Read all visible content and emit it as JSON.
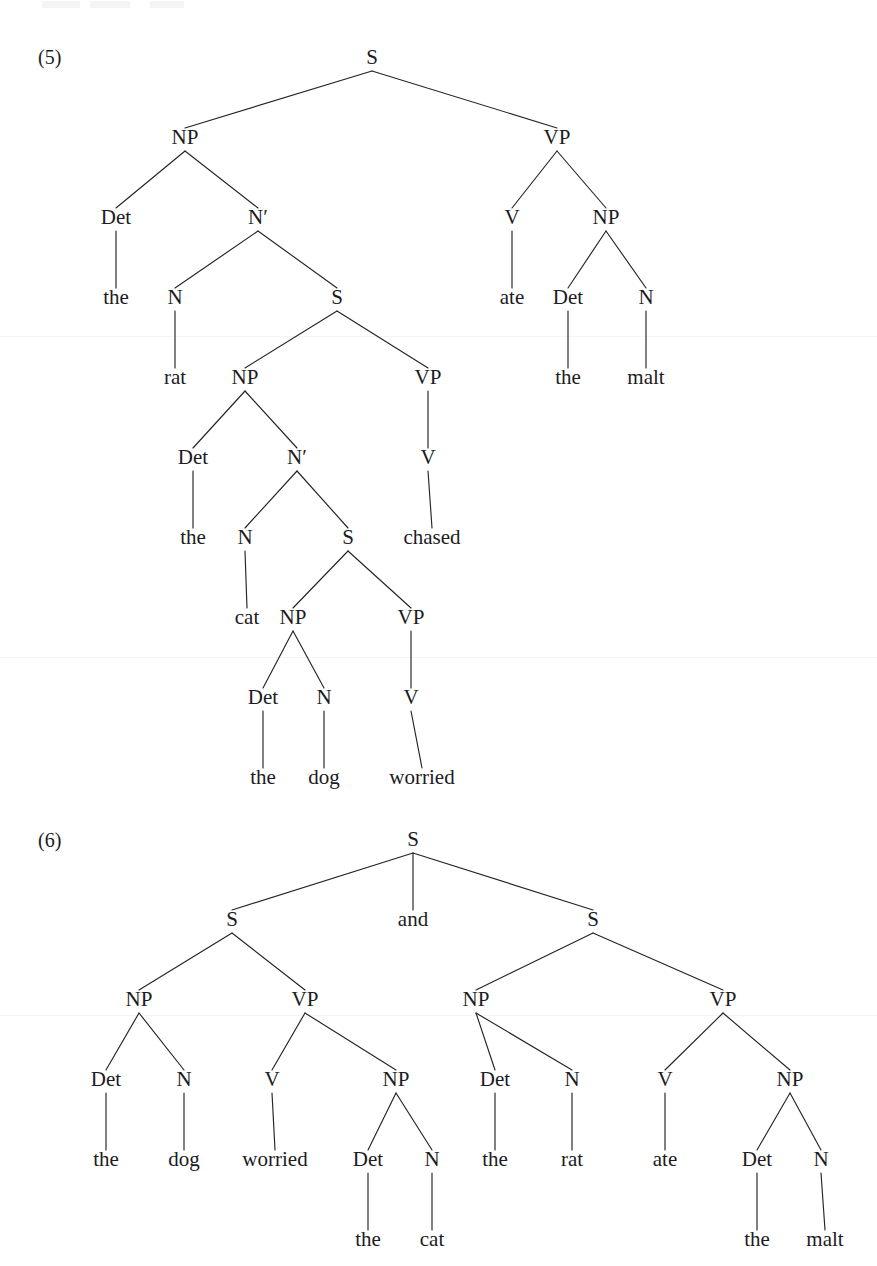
{
  "page": {
    "background": "#ffffff",
    "ink_color": "#1b1b22",
    "width": 877,
    "height": 1266
  },
  "examples": [
    {
      "id": "example-5",
      "number": "(5)",
      "number_x": 38,
      "number_y": 64,
      "sentence": "the rat the cat the dog worried chased ate the malt",
      "nodes": [
        {
          "name": "s-root",
          "label": "S",
          "x": 372,
          "y": 64,
          "type": "category"
        },
        {
          "name": "np-subject",
          "label": "NP",
          "x": 185,
          "y": 144,
          "type": "category"
        },
        {
          "name": "vp-main",
          "label": "VP",
          "x": 557,
          "y": 144,
          "type": "category"
        },
        {
          "name": "det-1",
          "label": "Det",
          "x": 116,
          "y": 224,
          "type": "category"
        },
        {
          "name": "nbar-1",
          "label": "N′",
          "x": 258,
          "y": 224,
          "type": "category"
        },
        {
          "name": "v-main",
          "label": "V",
          "x": 512,
          "y": 224,
          "type": "category"
        },
        {
          "name": "np-object",
          "label": "NP",
          "x": 606,
          "y": 224,
          "type": "category"
        },
        {
          "name": "the-1",
          "label": "the",
          "x": 116,
          "y": 304,
          "type": "terminal"
        },
        {
          "name": "n-1",
          "label": "N",
          "x": 175,
          "y": 304,
          "type": "category"
        },
        {
          "name": "s-relative-1",
          "label": "S",
          "x": 337,
          "y": 304,
          "type": "category"
        },
        {
          "name": "ate",
          "label": "ate",
          "x": 512,
          "y": 304,
          "type": "terminal"
        },
        {
          "name": "det-object",
          "label": "Det",
          "x": 568,
          "y": 304,
          "type": "category"
        },
        {
          "name": "n-object",
          "label": "N",
          "x": 646,
          "y": 304,
          "type": "category"
        },
        {
          "name": "rat",
          "label": "rat",
          "x": 175,
          "y": 384,
          "type": "terminal"
        },
        {
          "name": "np-embedded-1",
          "label": "NP",
          "x": 245,
          "y": 384,
          "type": "category"
        },
        {
          "name": "vp-embedded-1",
          "label": "VP",
          "x": 428,
          "y": 384,
          "type": "category"
        },
        {
          "name": "the-object",
          "label": "the",
          "x": 568,
          "y": 384,
          "type": "terminal"
        },
        {
          "name": "malt",
          "label": "malt",
          "x": 646,
          "y": 384,
          "type": "terminal"
        },
        {
          "name": "det-2",
          "label": "Det",
          "x": 193,
          "y": 464,
          "type": "category"
        },
        {
          "name": "nbar-2",
          "label": "N′",
          "x": 297,
          "y": 464,
          "type": "category"
        },
        {
          "name": "v-embedded-1",
          "label": "V",
          "x": 428,
          "y": 464,
          "type": "category"
        },
        {
          "name": "the-2",
          "label": "the",
          "x": 193,
          "y": 544,
          "type": "terminal"
        },
        {
          "name": "n-2",
          "label": "N",
          "x": 245,
          "y": 544,
          "type": "category"
        },
        {
          "name": "s-relative-2",
          "label": "S",
          "x": 348,
          "y": 544,
          "type": "category"
        },
        {
          "name": "chased",
          "label": "chased",
          "x": 432,
          "y": 544,
          "type": "terminal"
        },
        {
          "name": "cat",
          "label": "cat",
          "x": 247,
          "y": 624,
          "type": "terminal"
        },
        {
          "name": "np-embedded-2",
          "label": "NP",
          "x": 293,
          "y": 624,
          "type": "category"
        },
        {
          "name": "vp-embedded-2",
          "label": "VP",
          "x": 411,
          "y": 624,
          "type": "category"
        },
        {
          "name": "det-3",
          "label": "Det",
          "x": 263,
          "y": 704,
          "type": "category"
        },
        {
          "name": "n-3",
          "label": "N",
          "x": 324,
          "y": 704,
          "type": "category"
        },
        {
          "name": "v-embedded-2",
          "label": "V",
          "x": 411,
          "y": 704,
          "type": "category"
        },
        {
          "name": "the-3",
          "label": "the",
          "x": 263,
          "y": 784,
          "type": "terminal"
        },
        {
          "name": "dog",
          "label": "dog",
          "x": 324,
          "y": 784,
          "type": "terminal"
        },
        {
          "name": "worried",
          "label": "worried",
          "x": 422,
          "y": 784,
          "type": "terminal"
        }
      ],
      "edges": [
        {
          "name": "edge-s-np",
          "from": "s-root",
          "to": "np-subject"
        },
        {
          "name": "edge-s-vp",
          "from": "s-root",
          "to": "vp-main"
        },
        {
          "name": "edge-np-det",
          "from": "np-subject",
          "to": "det-1"
        },
        {
          "name": "edge-np-nbar",
          "from": "np-subject",
          "to": "nbar-1"
        },
        {
          "name": "edge-vp-v",
          "from": "vp-main",
          "to": "v-main"
        },
        {
          "name": "edge-vp-np",
          "from": "vp-main",
          "to": "np-object"
        },
        {
          "name": "edge-det1-the",
          "from": "det-1",
          "to": "the-1"
        },
        {
          "name": "edge-nbar1-n",
          "from": "nbar-1",
          "to": "n-1"
        },
        {
          "name": "edge-nbar1-s",
          "from": "nbar-1",
          "to": "s-relative-1"
        },
        {
          "name": "edge-vmain-ate",
          "from": "v-main",
          "to": "ate"
        },
        {
          "name": "edge-npobj-det",
          "from": "np-object",
          "to": "det-object"
        },
        {
          "name": "edge-npobj-n",
          "from": "np-object",
          "to": "n-object"
        },
        {
          "name": "edge-n1-rat",
          "from": "n-1",
          "to": "rat"
        },
        {
          "name": "edge-srel1-np",
          "from": "s-relative-1",
          "to": "np-embedded-1"
        },
        {
          "name": "edge-srel1-vp",
          "from": "s-relative-1",
          "to": "vp-embedded-1"
        },
        {
          "name": "edge-detobj-the",
          "from": "det-object",
          "to": "the-object"
        },
        {
          "name": "edge-nobj-malt",
          "from": "n-object",
          "to": "malt"
        },
        {
          "name": "edge-npemb1-det",
          "from": "np-embedded-1",
          "to": "det-2"
        },
        {
          "name": "edge-npemb1-nbar",
          "from": "np-embedded-1",
          "to": "nbar-2"
        },
        {
          "name": "edge-vpemb1-v",
          "from": "vp-embedded-1",
          "to": "v-embedded-1"
        },
        {
          "name": "edge-det2-the",
          "from": "det-2",
          "to": "the-2"
        },
        {
          "name": "edge-nbar2-n",
          "from": "nbar-2",
          "to": "n-2"
        },
        {
          "name": "edge-nbar2-s",
          "from": "nbar-2",
          "to": "s-relative-2"
        },
        {
          "name": "edge-vemb1-chased",
          "from": "v-embedded-1",
          "to": "chased"
        },
        {
          "name": "edge-n2-cat",
          "from": "n-2",
          "to": "cat"
        },
        {
          "name": "edge-srel2-np",
          "from": "s-relative-2",
          "to": "np-embedded-2"
        },
        {
          "name": "edge-srel2-vp",
          "from": "s-relative-2",
          "to": "vp-embedded-2"
        },
        {
          "name": "edge-npemb2-det",
          "from": "np-embedded-2",
          "to": "det-3"
        },
        {
          "name": "edge-npemb2-n",
          "from": "np-embedded-2",
          "to": "n-3"
        },
        {
          "name": "edge-vpemb2-v",
          "from": "vp-embedded-2",
          "to": "v-embedded-2"
        },
        {
          "name": "edge-det3-the",
          "from": "det-3",
          "to": "the-3"
        },
        {
          "name": "edge-n3-dog",
          "from": "n-3",
          "to": "dog"
        },
        {
          "name": "edge-vemb2-worried",
          "from": "v-embedded-2",
          "to": "worried"
        }
      ]
    },
    {
      "id": "example-6",
      "number": "(6)",
      "number_x": 38,
      "number_y": 847,
      "sentence": "the dog worried the cat and the rat ate the malt",
      "nodes": [
        {
          "name": "s-root",
          "label": "S",
          "x": 413,
          "y": 846,
          "type": "category"
        },
        {
          "name": "s-left",
          "label": "S",
          "x": 232,
          "y": 926,
          "type": "category"
        },
        {
          "name": "and",
          "label": "and",
          "x": 413,
          "y": 926,
          "type": "terminal"
        },
        {
          "name": "s-right",
          "label": "S",
          "x": 593,
          "y": 926,
          "type": "category"
        },
        {
          "name": "np-left",
          "label": "NP",
          "x": 139,
          "y": 1006,
          "type": "category"
        },
        {
          "name": "vp-left",
          "label": "VP",
          "x": 305,
          "y": 1006,
          "type": "category"
        },
        {
          "name": "np-right",
          "label": "NP",
          "x": 476,
          "y": 1006,
          "type": "category"
        },
        {
          "name": "vp-right",
          "label": "VP",
          "x": 723,
          "y": 1006,
          "type": "category"
        },
        {
          "name": "det-left-subj",
          "label": "Det",
          "x": 106,
          "y": 1086,
          "type": "category"
        },
        {
          "name": "n-left-subj",
          "label": "N",
          "x": 184,
          "y": 1086,
          "type": "category"
        },
        {
          "name": "v-left",
          "label": "V",
          "x": 272,
          "y": 1086,
          "type": "category"
        },
        {
          "name": "np-left-obj",
          "label": "NP",
          "x": 396,
          "y": 1086,
          "type": "category"
        },
        {
          "name": "det-right-subj",
          "label": "Det",
          "x": 495,
          "y": 1086,
          "type": "category"
        },
        {
          "name": "n-right-subj",
          "label": "N",
          "x": 572,
          "y": 1086,
          "type": "category"
        },
        {
          "name": "v-right",
          "label": "V",
          "x": 665,
          "y": 1086,
          "type": "category"
        },
        {
          "name": "np-right-obj",
          "label": "NP",
          "x": 790,
          "y": 1086,
          "type": "category"
        },
        {
          "name": "the-left-subj",
          "label": "the",
          "x": 106,
          "y": 1166,
          "type": "terminal"
        },
        {
          "name": "dog",
          "label": "dog",
          "x": 184,
          "y": 1166,
          "type": "terminal"
        },
        {
          "name": "worried",
          "label": "worried",
          "x": 275,
          "y": 1166,
          "type": "terminal"
        },
        {
          "name": "det-left-obj",
          "label": "Det",
          "x": 368,
          "y": 1166,
          "type": "category"
        },
        {
          "name": "n-left-obj",
          "label": "N",
          "x": 432,
          "y": 1166,
          "type": "category"
        },
        {
          "name": "the-right-subj",
          "label": "the",
          "x": 495,
          "y": 1166,
          "type": "terminal"
        },
        {
          "name": "rat",
          "label": "rat",
          "x": 572,
          "y": 1166,
          "type": "terminal"
        },
        {
          "name": "ate",
          "label": "ate",
          "x": 665,
          "y": 1166,
          "type": "terminal"
        },
        {
          "name": "det-right-obj",
          "label": "Det",
          "x": 757,
          "y": 1166,
          "type": "category"
        },
        {
          "name": "n-right-obj",
          "label": "N",
          "x": 821,
          "y": 1166,
          "type": "category"
        },
        {
          "name": "the-left-obj",
          "label": "the",
          "x": 368,
          "y": 1246,
          "type": "terminal"
        },
        {
          "name": "cat",
          "label": "cat",
          "x": 432,
          "y": 1246,
          "type": "terminal"
        },
        {
          "name": "the-right-obj",
          "label": "the",
          "x": 757,
          "y": 1246,
          "type": "terminal"
        },
        {
          "name": "malt",
          "label": "malt",
          "x": 825,
          "y": 1246,
          "type": "terminal"
        }
      ],
      "edges": [
        {
          "name": "edge-root-sleft",
          "from": "s-root",
          "to": "s-left"
        },
        {
          "name": "edge-root-and",
          "from": "s-root",
          "to": "and"
        },
        {
          "name": "edge-root-sright",
          "from": "s-root",
          "to": "s-right"
        },
        {
          "name": "edge-sleft-np",
          "from": "s-left",
          "to": "np-left"
        },
        {
          "name": "edge-sleft-vp",
          "from": "s-left",
          "to": "vp-left"
        },
        {
          "name": "edge-sright-np",
          "from": "s-right",
          "to": "np-right"
        },
        {
          "name": "edge-sright-vp",
          "from": "s-right",
          "to": "vp-right"
        },
        {
          "name": "edge-npleft-det",
          "from": "np-left",
          "to": "det-left-subj"
        },
        {
          "name": "edge-npleft-n",
          "from": "np-left",
          "to": "n-left-subj"
        },
        {
          "name": "edge-vpleft-v",
          "from": "vp-left",
          "to": "v-left"
        },
        {
          "name": "edge-vpleft-np",
          "from": "vp-left",
          "to": "np-left-obj"
        },
        {
          "name": "edge-npright-det",
          "from": "np-right",
          "to": "det-right-subj"
        },
        {
          "name": "edge-npright-n",
          "from": "np-right",
          "to": "n-right-subj"
        },
        {
          "name": "edge-vpright-v",
          "from": "vp-right",
          "to": "v-right"
        },
        {
          "name": "edge-vpright-np",
          "from": "vp-right",
          "to": "np-right-obj"
        },
        {
          "name": "edge-detleftsubj-the",
          "from": "det-left-subj",
          "to": "the-left-subj"
        },
        {
          "name": "edge-nleftsubj-dog",
          "from": "n-left-subj",
          "to": "dog"
        },
        {
          "name": "edge-vleft-worried",
          "from": "v-left",
          "to": "worried"
        },
        {
          "name": "edge-npleftobj-det",
          "from": "np-left-obj",
          "to": "det-left-obj"
        },
        {
          "name": "edge-npleftobj-n",
          "from": "np-left-obj",
          "to": "n-left-obj"
        },
        {
          "name": "edge-detrightsubj-the",
          "from": "det-right-subj",
          "to": "the-right-subj"
        },
        {
          "name": "edge-nrightsubj-rat",
          "from": "n-right-subj",
          "to": "rat"
        },
        {
          "name": "edge-vright-ate",
          "from": "v-right",
          "to": "ate"
        },
        {
          "name": "edge-nprightobj-det",
          "from": "np-right-obj",
          "to": "det-right-obj"
        },
        {
          "name": "edge-nprightobj-n",
          "from": "np-right-obj",
          "to": "n-right-obj"
        },
        {
          "name": "edge-detleftobj-the",
          "from": "det-left-obj",
          "to": "the-left-obj"
        },
        {
          "name": "edge-nleftobj-cat",
          "from": "n-left-obj",
          "to": "cat"
        },
        {
          "name": "edge-detrightobj-the",
          "from": "det-right-obj",
          "to": "the-right-obj"
        },
        {
          "name": "edge-nrightobj-malt",
          "from": "n-right-obj",
          "to": "malt"
        }
      ]
    }
  ],
  "artifacts": {
    "scan_seams_y": [
      336,
      657,
      1015
    ],
    "seam_color": "#f4f4f6"
  }
}
